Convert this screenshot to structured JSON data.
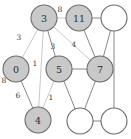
{
  "figure": {
    "kind": "undirected-weighted-graph",
    "background_color": "#ffffff",
    "width": 131,
    "height": 139
  },
  "style": {
    "filled_node_fill": "#c9c9c9",
    "empty_node_fill": "#ffffff",
    "node_stroke": "#6b6b6b",
    "edge_color": "#7a7a7a",
    "edge_color_light": "#c2c2c2",
    "label_color": "#2b2b2b"
  },
  "chart_data": {
    "type": "graph",
    "title": "",
    "nodes": [
      {
        "id": "n3",
        "label": "3",
        "cx": 44,
        "cy": 18,
        "r": 13,
        "filled": true
      },
      {
        "id": "n11",
        "label": "11",
        "cx": 79,
        "cy": 18,
        "r": 13,
        "filled": true
      },
      {
        "id": "ntr",
        "label": "",
        "cx": 114,
        "cy": 18,
        "r": 13,
        "filled": false
      },
      {
        "id": "n0",
        "label": "0",
        "cx": 16,
        "cy": 69,
        "r": 13,
        "filled": true
      },
      {
        "id": "n5",
        "label": "5",
        "cx": 59,
        "cy": 69,
        "r": 13,
        "filled": true
      },
      {
        "id": "n7",
        "label": "7",
        "cx": 100,
        "cy": 69,
        "r": 13,
        "filled": true
      },
      {
        "id": "n4",
        "label": "4",
        "cx": 38,
        "cy": 120,
        "r": 13,
        "filled": true
      },
      {
        "id": "nbm",
        "label": "",
        "cx": 80,
        "cy": 121,
        "r": 13,
        "filled": false
      },
      {
        "id": "nbr",
        "label": "",
        "cx": 114,
        "cy": 121,
        "r": 13,
        "filled": false
      }
    ],
    "edges": [
      {
        "source": "n3",
        "target": "n11",
        "weight": "8",
        "lx": 60,
        "ly": 9,
        "light": true
      },
      {
        "source": "n11",
        "target": "ntr",
        "weight": "",
        "lx": 0,
        "ly": 0,
        "light": false
      },
      {
        "source": "n11",
        "target": "n7",
        "weight": "",
        "lx": 0,
        "ly": 0,
        "light": false
      },
      {
        "source": "ntr",
        "target": "n7",
        "weight": "",
        "lx": 0,
        "ly": 0,
        "light": false
      },
      {
        "source": "ntr",
        "target": "nbr",
        "weight": "",
        "lx": 0,
        "ly": 0,
        "light": false
      },
      {
        "source": "n3",
        "target": "n0",
        "weight": "3",
        "lx": 19,
        "ly": 37,
        "light": true
      },
      {
        "source": "n3",
        "target": "n5",
        "weight": "3",
        "lx": 53,
        "ly": 46,
        "light": false
      },
      {
        "source": "n3",
        "target": "n7",
        "weight": "4",
        "lx": 74,
        "ly": 44,
        "light": true
      },
      {
        "source": "n3",
        "target": "n4",
        "weight": "1",
        "lx": 35,
        "ly": 63,
        "light": true
      },
      {
        "source": "n0",
        "target": "n4",
        "weight": "6",
        "lx": 18,
        "ly": 95,
        "light": false
      },
      {
        "source": "n5",
        "target": "n4",
        "weight": "1",
        "lx": 51,
        "ly": 97,
        "light": true
      },
      {
        "source": "n5",
        "target": "n7",
        "weight": "",
        "lx": 0,
        "ly": 0,
        "light": false
      },
      {
        "source": "n5",
        "target": "nbm",
        "weight": "",
        "lx": 0,
        "ly": 0,
        "light": false
      },
      {
        "source": "n7",
        "target": "nbm",
        "weight": "",
        "lx": 0,
        "ly": 0,
        "light": false
      },
      {
        "source": "nbm",
        "target": "nbr",
        "weight": "",
        "lx": 0,
        "ly": 0,
        "light": false
      }
    ],
    "stray_labels": [
      {
        "text": "8",
        "lx": 4,
        "ly": 80
      }
    ]
  }
}
